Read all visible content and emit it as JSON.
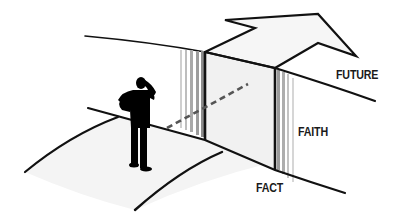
{
  "diagram": {
    "labels": {
      "future": "FUTURE",
      "faith": "FAITH",
      "fact": "FACT"
    },
    "elements": [
      "road-fact",
      "gap-faith",
      "road-future",
      "arrow-up",
      "person-silhouette",
      "dashed-path"
    ],
    "colors": {
      "line": "#111111",
      "road_fill": "#f5f5f5",
      "gap_fill": "#f2f2f2",
      "arrow_fill": "#f7f7f7",
      "stripe": "#9a9a9a",
      "person": "#000000"
    }
  }
}
